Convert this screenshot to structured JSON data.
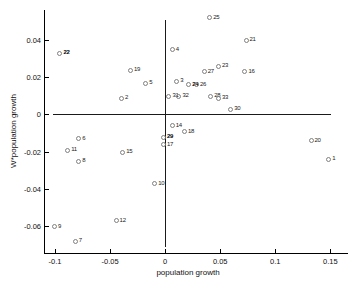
{
  "figure": {
    "background": "#ffffff",
    "axis_color": "#000000",
    "refline_color": "#1a1a1a",
    "marker_color": "#808080",
    "label_color": "#1a1a1a"
  },
  "chart_data": {
    "type": "scatter",
    "title": "",
    "xlabel": "population growth",
    "ylabel": "W*population growth",
    "xlim": [
      -0.11,
      0.166
    ],
    "ylim": [
      -0.0745,
      0.056
    ],
    "xticks": [
      -0.1,
      -0.05,
      0,
      0.05,
      0.1,
      0.15
    ],
    "xtick_labels": [
      "-0.1",
      "-0.05",
      "0",
      "0.05",
      "0.1",
      "0.15"
    ],
    "yticks": [
      -0.06,
      -0.04,
      -0.02,
      0,
      0.02,
      0.04
    ],
    "ytick_labels": [
      "-0.06",
      "-0.04",
      "-0.02",
      "0",
      "0.02",
      "0.04"
    ],
    "grid": false,
    "legend": "none",
    "reference_lines": {
      "vertical_at_x": 0,
      "horizontal_at_y": 0
    },
    "marker": "open-circle",
    "points": [
      {
        "label": "1",
        "x": 0.148,
        "y": -0.024,
        "bold": false
      },
      {
        "label": "2",
        "x": -0.04,
        "y": 0.009,
        "bold": false
      },
      {
        "label": "3",
        "x": 0.01,
        "y": 0.018,
        "bold": false
      },
      {
        "label": "4",
        "x": 0.006,
        "y": 0.035,
        "bold": false
      },
      {
        "label": "5",
        "x": -0.018,
        "y": 0.017,
        "bold": false
      },
      {
        "label": "6",
        "x": -0.079,
        "y": -0.013,
        "bold": false
      },
      {
        "label": "7",
        "x": -0.082,
        "y": -0.068,
        "bold": false
      },
      {
        "label": "8",
        "x": -0.079,
        "y": -0.025,
        "bold": false
      },
      {
        "label": "9",
        "x": -0.101,
        "y": -0.06,
        "bold": false
      },
      {
        "label": "10",
        "x": -0.01,
        "y": -0.037,
        "bold": false
      },
      {
        "label": "11",
        "x": -0.089,
        "y": -0.019,
        "bold": false
      },
      {
        "label": "12",
        "x": -0.045,
        "y": -0.057,
        "bold": false
      },
      {
        "label": "14",
        "x": 0.006,
        "y": -0.006,
        "bold": false
      },
      {
        "label": "15",
        "x": -0.039,
        "y": -0.02,
        "bold": false
      },
      {
        "label": "16",
        "x": 0.072,
        "y": 0.023,
        "bold": false
      },
      {
        "label": "17",
        "x": -0.002,
        "y": -0.016,
        "bold": false
      },
      {
        "label": "18",
        "x": 0.017,
        "y": -0.009,
        "bold": false
      },
      {
        "label": "19",
        "x": -0.032,
        "y": 0.024,
        "bold": false
      },
      {
        "label": "20",
        "x": 0.132,
        "y": -0.014,
        "bold": false
      },
      {
        "label": "21",
        "x": 0.073,
        "y": 0.04,
        "bold": false
      },
      {
        "label": "22",
        "x": -0.096,
        "y": 0.033,
        "bold": true
      },
      {
        "label": "23",
        "x": 0.048,
        "y": 0.026,
        "bold": false
      },
      {
        "label": "24",
        "x": 0.021,
        "y": 0.016,
        "bold": true
      },
      {
        "label": "25",
        "x": 0.04,
        "y": 0.052,
        "bold": false
      },
      {
        "label": "26",
        "x": 0.028,
        "y": 0.016,
        "bold": false
      },
      {
        "label": "27",
        "x": 0.035,
        "y": 0.023,
        "bold": false
      },
      {
        "label": "28",
        "x": 0.041,
        "y": 0.01,
        "bold": false
      },
      {
        "label": "29",
        "x": -0.002,
        "y": -0.012,
        "bold": true
      },
      {
        "label": "30",
        "x": 0.059,
        "y": 0.003,
        "bold": false
      },
      {
        "label": "31",
        "x": 0.003,
        "y": 0.01,
        "bold": false
      },
      {
        "label": "32",
        "x": 0.012,
        "y": 0.01,
        "bold": false
      },
      {
        "label": "33",
        "x": 0.048,
        "y": 0.009,
        "bold": false
      }
    ]
  }
}
